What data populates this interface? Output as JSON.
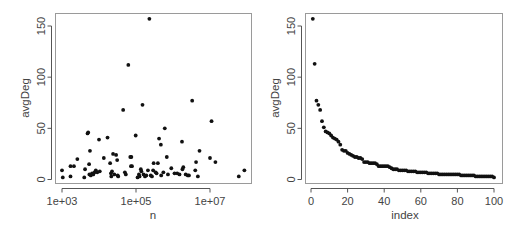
{
  "chart_data": [
    {
      "type": "scatter",
      "title": "",
      "xlabel": "n",
      "ylabel": "avgDeg",
      "xscale": "log10",
      "xlim": [
        1000,
        100000000
      ],
      "ylim": [
        0,
        160
      ],
      "x_ticks": [
        1000,
        100000,
        10000000
      ],
      "x_tick_labels": [
        "1e+03",
        "1e+05",
        "1e+07"
      ],
      "y_ticks": [
        0,
        50,
        100,
        150
      ],
      "y_tick_labels": [
        "0",
        "50",
        "100",
        "150"
      ],
      "grid": false,
      "legend": null,
      "points": [
        {
          "n": 1000,
          "avgDeg": 9
        },
        {
          "n": 1050,
          "avgDeg": 2
        },
        {
          "n": 1700,
          "avgDeg": 13
        },
        {
          "n": 1700,
          "avgDeg": 3
        },
        {
          "n": 2100,
          "avgDeg": 13
        },
        {
          "n": 2600,
          "avgDeg": 20
        },
        {
          "n": 4200,
          "avgDeg": 10
        },
        {
          "n": 4000,
          "avgDeg": 2
        },
        {
          "n": 4900,
          "avgDeg": 45
        },
        {
          "n": 5100,
          "avgDeg": 46
        },
        {
          "n": 5400,
          "avgDeg": 15
        },
        {
          "n": 5700,
          "avgDeg": 28
        },
        {
          "n": 5500,
          "avgDeg": 5
        },
        {
          "n": 6000,
          "avgDeg": 4
        },
        {
          "n": 6500,
          "avgDeg": 6
        },
        {
          "n": 7000,
          "avgDeg": 5
        },
        {
          "n": 7600,
          "avgDeg": 7
        },
        {
          "n": 8200,
          "avgDeg": 9
        },
        {
          "n": 9000,
          "avgDeg": 7
        },
        {
          "n": 10000,
          "avgDeg": 39
        },
        {
          "n": 10500,
          "avgDeg": 8
        },
        {
          "n": 13500,
          "avgDeg": 21
        },
        {
          "n": 17000,
          "avgDeg": 41
        },
        {
          "n": 20000,
          "avgDeg": 16
        },
        {
          "n": 21000,
          "avgDeg": 6
        },
        {
          "n": 21500,
          "avgDeg": 3
        },
        {
          "n": 22500,
          "avgDeg": 8
        },
        {
          "n": 24000,
          "avgDeg": 25
        },
        {
          "n": 26000,
          "avgDeg": 5
        },
        {
          "n": 29000,
          "avgDeg": 24
        },
        {
          "n": 31000,
          "avgDeg": 19
        },
        {
          "n": 32000,
          "avgDeg": 4
        },
        {
          "n": 33000,
          "avgDeg": 3
        },
        {
          "n": 45000,
          "avgDeg": 68
        },
        {
          "n": 50000,
          "avgDeg": 7
        },
        {
          "n": 53000,
          "avgDeg": 5
        },
        {
          "n": 62000,
          "avgDeg": 112
        },
        {
          "n": 70000,
          "avgDeg": 22
        },
        {
          "n": 73000,
          "avgDeg": 13
        },
        {
          "n": 78000,
          "avgDeg": 13
        },
        {
          "n": 75000,
          "avgDeg": 22
        },
        {
          "n": 98000,
          "avgDeg": 43
        },
        {
          "n": 110000,
          "avgDeg": 2
        },
        {
          "n": 120000,
          "avgDeg": 5
        },
        {
          "n": 125000,
          "avgDeg": 3
        },
        {
          "n": 135000,
          "avgDeg": 10
        },
        {
          "n": 140000,
          "avgDeg": 8
        },
        {
          "n": 150000,
          "avgDeg": 73
        },
        {
          "n": 160000,
          "avgDeg": 5
        },
        {
          "n": 175000,
          "avgDeg": 3
        },
        {
          "n": 190000,
          "avgDeg": 4
        },
        {
          "n": 210000,
          "avgDeg": 9
        },
        {
          "n": 230000,
          "avgDeg": 157
        },
        {
          "n": 250000,
          "avgDeg": 4
        },
        {
          "n": 270000,
          "avgDeg": 3
        },
        {
          "n": 290000,
          "avgDeg": 9
        },
        {
          "n": 300000,
          "avgDeg": 16
        },
        {
          "n": 340000,
          "avgDeg": 7
        },
        {
          "n": 360000,
          "avgDeg": 6
        },
        {
          "n": 390000,
          "avgDeg": 16
        },
        {
          "n": 420000,
          "avgDeg": 40
        },
        {
          "n": 470000,
          "avgDeg": 34
        },
        {
          "n": 480000,
          "avgDeg": 4
        },
        {
          "n": 550000,
          "avgDeg": 7
        },
        {
          "n": 600000,
          "avgDeg": 50
        },
        {
          "n": 680000,
          "avgDeg": 22
        },
        {
          "n": 730000,
          "avgDeg": 5
        },
        {
          "n": 900000,
          "avgDeg": 11
        },
        {
          "n": 1100000,
          "avgDeg": 6
        },
        {
          "n": 1300000,
          "avgDeg": 6
        },
        {
          "n": 1500000,
          "avgDeg": 5
        },
        {
          "n": 1750000,
          "avgDeg": 37
        },
        {
          "n": 1900000,
          "avgDeg": 12
        },
        {
          "n": 1800000,
          "avgDeg": 10
        },
        {
          "n": 2200000,
          "avgDeg": 5
        },
        {
          "n": 2500000,
          "avgDeg": 4
        },
        {
          "n": 2700000,
          "avgDeg": 4
        },
        {
          "n": 3300000,
          "avgDeg": 77
        },
        {
          "n": 4000000,
          "avgDeg": 9
        },
        {
          "n": 4200000,
          "avgDeg": 17
        },
        {
          "n": 4700000,
          "avgDeg": 3
        },
        {
          "n": 5200000,
          "avgDeg": 28
        },
        {
          "n": 10000000,
          "avgDeg": 21
        },
        {
          "n": 11000000,
          "avgDeg": 57
        },
        {
          "n": 14000000,
          "avgDeg": 17
        },
        {
          "n": 60000000,
          "avgDeg": 3
        },
        {
          "n": 85000000,
          "avgDeg": 9
        }
      ]
    },
    {
      "type": "scatter",
      "title": "",
      "xlabel": "index",
      "ylabel": "avgDeg",
      "xlim": [
        0,
        100
      ],
      "ylim": [
        0,
        160
      ],
      "x_ticks": [
        0,
        20,
        40,
        60,
        80,
        100
      ],
      "x_tick_labels": [
        "0",
        "20",
        "40",
        "60",
        "80",
        "100"
      ],
      "y_ticks": [
        0,
        50,
        100,
        150
      ],
      "y_tick_labels": [
        "0",
        "50",
        "100",
        "150"
      ],
      "grid": false,
      "legend": null,
      "x": [
        1,
        2,
        3,
        4,
        5,
        6,
        7,
        8,
        9,
        10,
        11,
        12,
        13,
        14,
        15,
        16,
        17,
        18,
        19,
        20,
        21,
        22,
        23,
        24,
        25,
        26,
        27,
        28,
        29,
        30,
        31,
        32,
        33,
        34,
        35,
        36,
        37,
        38,
        39,
        40,
        41,
        42,
        43,
        44,
        45,
        46,
        47,
        48,
        49,
        50,
        51,
        52,
        53,
        54,
        55,
        56,
        57,
        58,
        59,
        60,
        61,
        62,
        63,
        64,
        65,
        66,
        67,
        68,
        69,
        70,
        71,
        72,
        73,
        74,
        75,
        76,
        77,
        78,
        79,
        80,
        81,
        82,
        83,
        84,
        85,
        86,
        87,
        88,
        89,
        90,
        91,
        92,
        93,
        94,
        95,
        96,
        97,
        98,
        99,
        100
      ],
      "values": [
        157,
        113,
        77,
        73,
        68,
        57,
        51,
        47,
        46,
        45,
        43,
        41,
        40,
        39,
        37,
        34,
        29,
        28,
        28,
        26,
        25,
        24,
        23,
        22,
        22,
        21,
        21,
        20,
        17,
        17,
        17,
        16,
        16,
        16,
        16,
        15,
        13,
        13,
        13,
        13,
        13,
        13,
        12,
        11,
        10,
        10,
        10,
        9,
        9,
        9,
        9,
        9,
        8,
        8,
        8,
        8,
        8,
        7,
        7,
        7,
        7,
        7,
        7,
        6,
        6,
        6,
        6,
        6,
        6,
        5,
        5,
        5,
        5,
        5,
        5,
        5,
        5,
        5,
        5,
        5,
        5,
        4,
        4,
        4,
        4,
        4,
        4,
        4,
        4,
        3,
        3,
        3,
        3,
        3,
        3,
        3,
        3,
        3,
        3,
        2
      ]
    }
  ]
}
